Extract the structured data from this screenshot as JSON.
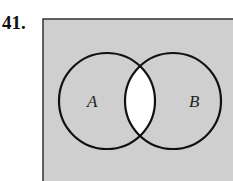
{
  "problem": {
    "number": "41."
  },
  "diagram": {
    "type": "venn",
    "universe_fill": "#cfcfcf",
    "sets": [
      {
        "label": "A",
        "cx": 107,
        "cy": 101,
        "r": 48
      },
      {
        "label": "B",
        "cx": 173,
        "cy": 101,
        "r": 48
      }
    ],
    "shaded_regions": [
      "complement of (A ∩ B)"
    ],
    "unshaded_regions": [
      "A ∩ B"
    ],
    "intersection_fill": "#ffffff",
    "stroke_color": "#111111"
  }
}
